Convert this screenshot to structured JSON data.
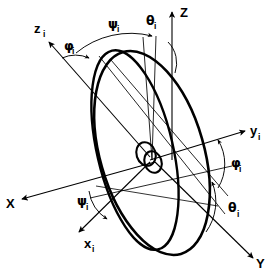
{
  "figure": {
    "background_color": "#ffffff",
    "stroke_color": "#000000"
  },
  "axes": {
    "Z": {
      "label": "Z",
      "subscript": "",
      "arrow": "up",
      "type": "inertial"
    },
    "X": {
      "label": "X",
      "subscript": "",
      "arrow": "left-down",
      "type": "inertial"
    },
    "Y": {
      "label": "Y",
      "subscript": "",
      "arrow": "right-down",
      "type": "inertial"
    },
    "zi": {
      "label": "z",
      "subscript": "i",
      "arrow": "up-left",
      "type": "orbit"
    },
    "xi": {
      "label": "x",
      "subscript": "i",
      "arrow": "down-left",
      "type": "orbit"
    },
    "yi": {
      "label": "y",
      "subscript": "i",
      "arrow": "right-up",
      "type": "orbit"
    }
  },
  "angles": [
    {
      "id": "theta-top",
      "symbol": "θ",
      "subscript": "i",
      "name": "theta-i-top",
      "position": "top-right of Z axis"
    },
    {
      "id": "psi-top",
      "symbol": "ψ",
      "subscript": "i",
      "name": "psi-i-top",
      "position": "top-center"
    },
    {
      "id": "phi-top",
      "symbol": "φ",
      "subscript": "i",
      "name": "phi-i-top-left",
      "position": "upper-left near z_i"
    },
    {
      "id": "phi-right",
      "symbol": "φ",
      "subscript": "i",
      "name": "phi-i-right",
      "position": "right, below y_i"
    },
    {
      "id": "theta-right",
      "symbol": "θ",
      "subscript": "i",
      "name": "theta-i-right",
      "position": "lower-right"
    },
    {
      "id": "psi-left",
      "symbol": "ψ",
      "subscript": "i",
      "name": "psi-i-lower-left",
      "position": "lower-left near x_i"
    }
  ],
  "labels": {
    "Z": "Z",
    "X": "X",
    "Y": "Y",
    "z_base": "z",
    "x_base": "x",
    "y_base": "y",
    "sub_i": "i",
    "theta": "θ",
    "psi": "ψ",
    "phi": "φ"
  }
}
